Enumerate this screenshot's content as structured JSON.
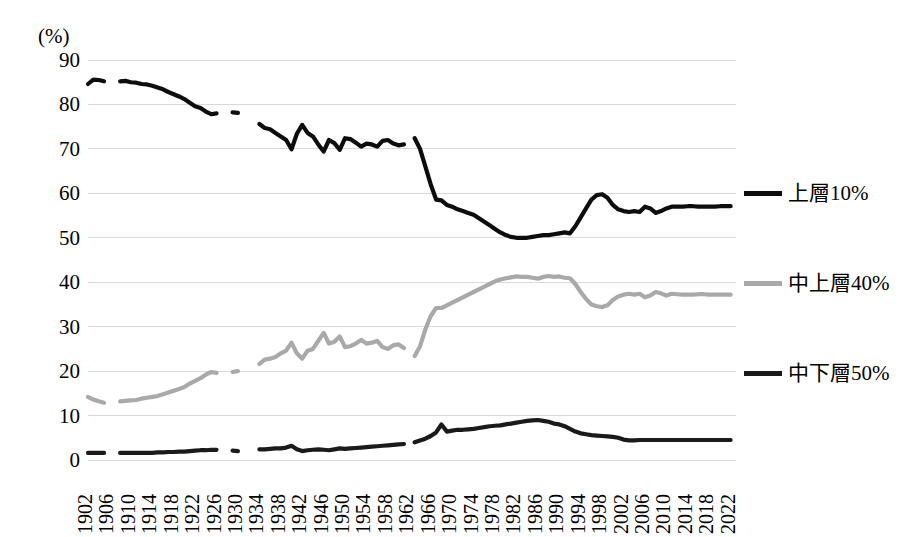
{
  "chart_data": {
    "type": "line",
    "title": "",
    "subtitle": "",
    "xlabel": "",
    "ylabel": "(%)",
    "unit_label": "(%)",
    "ylim": [
      0,
      90
    ],
    "ytick_step": 10,
    "yticks": [
      "90",
      "80",
      "70",
      "60",
      "50",
      "40",
      "30",
      "20",
      "10",
      "0"
    ],
    "xlim": [
      1902,
      2023
    ],
    "xtick_step": 4,
    "xticks": [
      "1902",
      "1906",
      "1910",
      "1914",
      "1918",
      "1922",
      "1926",
      "1930",
      "1934",
      "1938",
      "1942",
      "1946",
      "1950",
      "1954",
      "1958",
      "1962",
      "1966",
      "1970",
      "1974",
      "1978",
      "1982",
      "1986",
      "1990",
      "1994",
      "1998",
      "2002",
      "2006",
      "2010",
      "2014",
      "2018",
      "2022"
    ],
    "grid": "horizontal",
    "legend_position": "right",
    "colors": {
      "top": "#0d0d0d",
      "mid": "#a9a9a9",
      "bot": "#1a1a1a",
      "gridline": "#d9d9d9"
    },
    "series": [
      {
        "name": "上層10%",
        "key": "top",
        "color": "#0d0d0d",
        "segments": [
          {
            "x": [
              1902,
              1903,
              1904,
              1905
            ],
            "y": [
              84.6,
              85.6,
              85.5,
              85.2
            ]
          },
          {
            "x": [
              1908,
              1909,
              1910,
              1911,
              1912,
              1913,
              1914,
              1915,
              1916,
              1917,
              1918,
              1919,
              1920,
              1921,
              1922,
              1923,
              1924,
              1925,
              1926
            ],
            "y": [
              85.2,
              85.3,
              85.0,
              84.9,
              84.6,
              84.5,
              84.2,
              83.8,
              83.4,
              82.8,
              82.3,
              81.8,
              81.2,
              80.4,
              79.6,
              79.2,
              78.4,
              77.8,
              78.0
            ]
          },
          {
            "x": [
              1929,
              1930
            ],
            "y": [
              78.2,
              78.1
            ]
          },
          {
            "x": [
              1934,
              1935,
              1936,
              1937,
              1938,
              1939,
              1940,
              1941,
              1942,
              1943,
              1944,
              1945,
              1946,
              1947,
              1948,
              1949,
              1950,
              1951,
              1952,
              1953,
              1954,
              1955,
              1956,
              1957,
              1958,
              1959,
              1960,
              1961
            ],
            "y": [
              75.6,
              74.7,
              74.4,
              73.6,
              72.8,
              72.0,
              69.9,
              73.4,
              75.4,
              73.6,
              72.8,
              71.0,
              69.4,
              72.0,
              71.3,
              69.8,
              72.4,
              72.2,
              71.4,
              70.5,
              71.2,
              71.0,
              70.5,
              71.8,
              72.0,
              71.2,
              70.8,
              71.0
            ]
          },
          {
            "x": [
              1963,
              1964,
              1965,
              1966,
              1967,
              1968,
              1969,
              1970,
              1971,
              1972,
              1973,
              1974,
              1975,
              1976,
              1977,
              1978,
              1979,
              1980,
              1981,
              1982,
              1983,
              1984,
              1985,
              1986,
              1987,
              1988,
              1989,
              1990,
              1991,
              1992,
              1993,
              1994,
              1995,
              1996,
              1997,
              1998,
              1999,
              2000,
              2001,
              2002,
              2003,
              2004,
              2005,
              2006,
              2007,
              2008,
              2009,
              2010,
              2011,
              2012,
              2013,
              2014,
              2015,
              2016,
              2017,
              2018,
              2019,
              2020,
              2021,
              2022
            ],
            "y": [
              72.4,
              70.0,
              66.0,
              62.0,
              58.6,
              58.4,
              57.4,
              57.0,
              56.4,
              56.0,
              55.6,
              55.2,
              54.4,
              53.6,
              52.8,
              52.0,
              51.2,
              50.6,
              50.2,
              50.0,
              50.0,
              50.0,
              50.2,
              50.4,
              50.6,
              50.6,
              50.8,
              51.0,
              51.2,
              51.0,
              52.6,
              54.6,
              56.6,
              58.6,
              59.6,
              59.8,
              59.0,
              57.4,
              56.4,
              56.0,
              55.8,
              56.0,
              55.8,
              57.0,
              56.6,
              55.6,
              56.0,
              56.6,
              57.0,
              57.0,
              57.0,
              57.1,
              57.1,
              57.0,
              57.0,
              57.0,
              57.0,
              57.1,
              57.1,
              57.1
            ]
          }
        ]
      },
      {
        "name": "中上層40%",
        "key": "mid",
        "color": "#a9a9a9",
        "segments": [
          {
            "x": [
              1902,
              1903,
              1904,
              1905
            ],
            "y": [
              14.2,
              13.6,
              13.2,
              12.9
            ]
          },
          {
            "x": [
              1908,
              1909,
              1910,
              1911,
              1912,
              1913,
              1914,
              1915,
              1916,
              1917,
              1918,
              1919,
              1920,
              1921,
              1922,
              1923,
              1924,
              1925,
              1926
            ],
            "y": [
              13.2,
              13.3,
              13.4,
              13.5,
              13.8,
              14.0,
              14.2,
              14.4,
              14.8,
              15.2,
              15.6,
              16.0,
              16.4,
              17.2,
              17.8,
              18.4,
              19.2,
              19.8,
              19.6
            ]
          },
          {
            "x": [
              1929,
              1930
            ],
            "y": [
              19.8,
              20.0
            ]
          },
          {
            "x": [
              1934,
              1935,
              1936,
              1937,
              1938,
              1939,
              1940,
              1941,
              1942,
              1943,
              1944,
              1945,
              1946,
              1947,
              1948,
              1949,
              1950,
              1951,
              1952,
              1953,
              1954,
              1955,
              1956,
              1957,
              1958,
              1959,
              1960,
              1961
            ],
            "y": [
              21.6,
              22.6,
              22.8,
              23.2,
              24.0,
              24.6,
              26.4,
              24.0,
              22.8,
              24.6,
              25.0,
              26.8,
              28.6,
              26.2,
              26.6,
              27.8,
              25.4,
              25.6,
              26.2,
              27.0,
              26.2,
              26.4,
              26.8,
              25.4,
              25.0,
              25.8,
              26.0,
              25.2
            ]
          },
          {
            "x": [
              1963,
              1964,
              1965,
              1966,
              1967,
              1968,
              1969,
              1970,
              1971,
              1972,
              1973,
              1974,
              1975,
              1976,
              1977,
              1978,
              1979,
              1980,
              1981,
              1982,
              1983,
              1984,
              1985,
              1986,
              1987,
              1988,
              1989,
              1990,
              1991,
              1992,
              1993,
              1994,
              1995,
              1996,
              1997,
              1998,
              1999,
              2000,
              2001,
              2002,
              2003,
              2004,
              2005,
              2006,
              2007,
              2008,
              2009,
              2010,
              2011,
              2012,
              2013,
              2014,
              2015,
              2016,
              2017,
              2018,
              2019,
              2020,
              2021,
              2022
            ],
            "y": [
              23.4,
              25.6,
              29.4,
              32.4,
              34.2,
              34.2,
              34.8,
              35.4,
              36.0,
              36.6,
              37.2,
              37.8,
              38.4,
              39.0,
              39.6,
              40.2,
              40.6,
              40.9,
              41.1,
              41.3,
              41.2,
              41.2,
              41.0,
              40.8,
              41.2,
              41.4,
              41.2,
              41.3,
              41.0,
              40.9,
              39.6,
              37.8,
              36.2,
              35.0,
              34.6,
              34.4,
              34.8,
              36.0,
              36.8,
              37.2,
              37.4,
              37.2,
              37.4,
              36.6,
              37.0,
              37.8,
              37.5,
              37.0,
              37.4,
              37.3,
              37.2,
              37.2,
              37.2,
              37.3,
              37.3,
              37.2,
              37.2,
              37.2,
              37.2,
              37.2
            ]
          }
        ]
      },
      {
        "name": "中下層50%",
        "key": "bot",
        "color": "#1a1a1a",
        "segments": [
          {
            "x": [
              1902,
              1903,
              1904,
              1905
            ],
            "y": [
              1.6,
              1.6,
              1.6,
              1.6
            ]
          },
          {
            "x": [
              1908,
              1909,
              1910,
              1911,
              1912,
              1913,
              1914,
              1915,
              1916,
              1917,
              1918,
              1919,
              1920,
              1921,
              1922,
              1923,
              1924,
              1925,
              1926
            ],
            "y": [
              1.6,
              1.6,
              1.6,
              1.6,
              1.6,
              1.6,
              1.6,
              1.7,
              1.7,
              1.8,
              1.8,
              1.9,
              1.9,
              2.0,
              2.1,
              2.2,
              2.2,
              2.3,
              2.3
            ]
          },
          {
            "x": [
              1929,
              1930
            ],
            "y": [
              2.1,
              2.0
            ]
          },
          {
            "x": [
              1934,
              1935,
              1936,
              1937,
              1938,
              1939,
              1940,
              1941,
              1942,
              1943,
              1944,
              1945,
              1946,
              1947,
              1948,
              1949,
              1950,
              1951,
              1952,
              1953,
              1954,
              1955,
              1956,
              1957,
              1958,
              1959,
              1960,
              1961
            ],
            "y": [
              2.4,
              2.4,
              2.5,
              2.6,
              2.6,
              2.8,
              3.2,
              2.4,
              2.0,
              2.2,
              2.3,
              2.4,
              2.3,
              2.2,
              2.4,
              2.6,
              2.5,
              2.6,
              2.7,
              2.8,
              2.9,
              3.0,
              3.1,
              3.2,
              3.3,
              3.4,
              3.5,
              3.6
            ]
          },
          {
            "x": [
              1963,
              1964,
              1965,
              1966,
              1967,
              1968,
              1969,
              1970,
              1971,
              1972,
              1973,
              1974,
              1975,
              1976,
              1977,
              1978,
              1979,
              1980,
              1981,
              1982,
              1983,
              1984,
              1985,
              1986,
              1987,
              1988,
              1989,
              1990,
              1991,
              1992,
              1993,
              1994,
              1995,
              1996,
              1997,
              1998,
              1999,
              2000,
              2001,
              2002,
              2003,
              2004,
              2005,
              2006,
              2007,
              2008,
              2009,
              2010,
              2011,
              2012,
              2013,
              2014,
              2015,
              2016,
              2017,
              2018,
              2019,
              2020,
              2021,
              2022
            ],
            "y": [
              4.0,
              4.4,
              4.8,
              5.4,
              6.2,
              8.0,
              6.4,
              6.6,
              6.8,
              6.8,
              6.9,
              7.0,
              7.2,
              7.4,
              7.6,
              7.7,
              7.8,
              8.0,
              8.2,
              8.4,
              8.6,
              8.8,
              8.9,
              9.0,
              8.8,
              8.6,
              8.2,
              8.0,
              7.6,
              7.0,
              6.4,
              6.0,
              5.8,
              5.6,
              5.5,
              5.4,
              5.3,
              5.2,
              5.0,
              4.6,
              4.4,
              4.4,
              4.5,
              4.5,
              4.5,
              4.5,
              4.5,
              4.5,
              4.5,
              4.5,
              4.5,
              4.5,
              4.5,
              4.5,
              4.5,
              4.5,
              4.5,
              4.5,
              4.5,
              4.5
            ]
          }
        ]
      }
    ],
    "legend": [
      {
        "label": "上層10%",
        "color": "#0d0d0d",
        "key": "top"
      },
      {
        "label": "中上層40%",
        "color": "#a9a9a9",
        "key": "mid"
      },
      {
        "label": "中下層50%",
        "color": "#1a1a1a",
        "key": "bot"
      }
    ]
  }
}
